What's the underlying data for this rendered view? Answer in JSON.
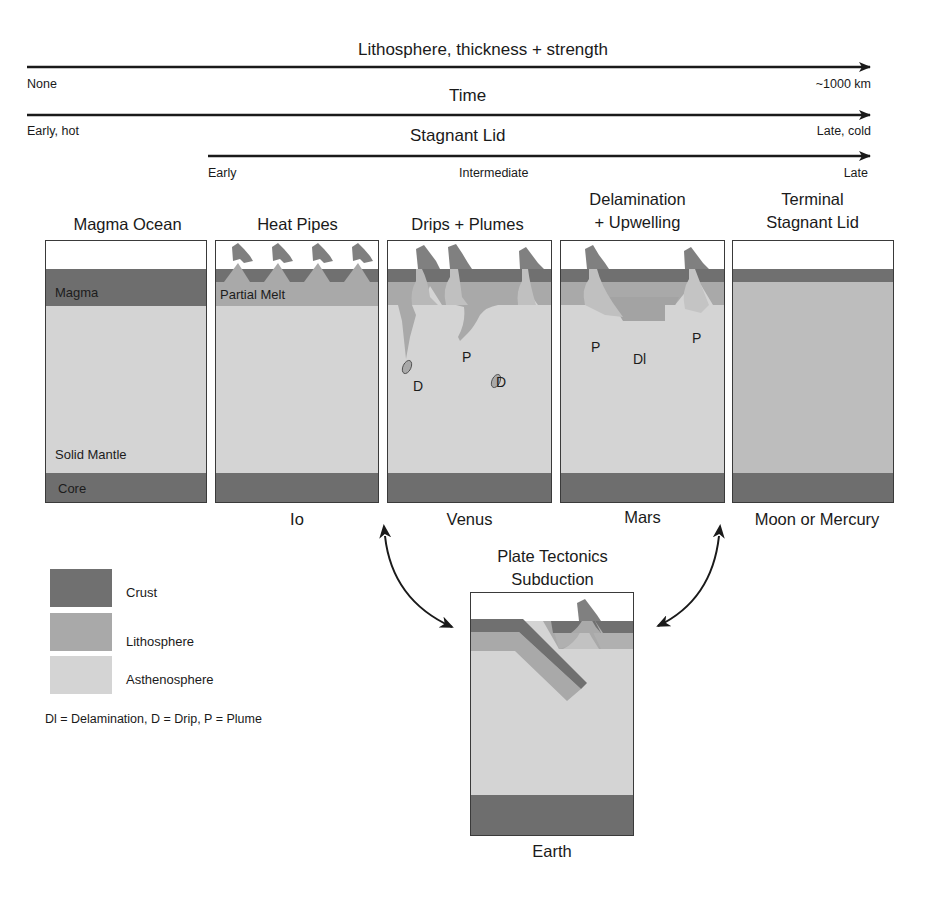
{
  "colors": {
    "crust": "#707070",
    "lithosphere": "#a9a9a9",
    "asthenosphere": "#d4d4d4",
    "core": "#6e6e6e",
    "magma": "#6e6e6e",
    "volcano": "#808080",
    "border": "#3a3a3a",
    "arrow": "#1a1a1a"
  },
  "axes": [
    {
      "title": "Lithosphere, thickness + strength",
      "left_label": "None",
      "right_label": "~1000 km"
    },
    {
      "title": "Time",
      "left_label": "Early, hot",
      "right_label": "Late, cold"
    },
    {
      "title": "Stagnant Lid",
      "left_label": "Early",
      "mid_label": "Intermediate",
      "right_label": "Late"
    }
  ],
  "stages": [
    {
      "title_line1": "",
      "title_line2": "Magma Ocean",
      "planet": "",
      "labels": {
        "magma": "Magma",
        "mantle": "Solid Mantle",
        "core": "Core"
      }
    },
    {
      "title_line1": "",
      "title_line2": "Heat Pipes",
      "planet": "Io",
      "labels": {
        "melt": "Partial Melt"
      }
    },
    {
      "title_line1": "",
      "title_line2": "Drips + Plumes",
      "planet": "Venus",
      "markers": [
        "D",
        "P",
        "D"
      ]
    },
    {
      "title_line1": "Delamination",
      "title_line2": "+ Upwelling",
      "planet": "Mars",
      "markers": [
        "P",
        "Dl",
        "P"
      ]
    },
    {
      "title_line1": "Terminal",
      "title_line2": "Stagnant Lid",
      "planet": "Moon or Mercury"
    }
  ],
  "plate_tectonics": {
    "title_line1": "Plate Tectonics",
    "title_line2": "Subduction",
    "planet": "Earth"
  },
  "legend": {
    "items": [
      {
        "label": "Crust"
      },
      {
        "label": "Lithosphere"
      },
      {
        "label": "Asthenosphere"
      }
    ],
    "footnote": "Dl = Delamination, D = Drip, P = Plume"
  }
}
